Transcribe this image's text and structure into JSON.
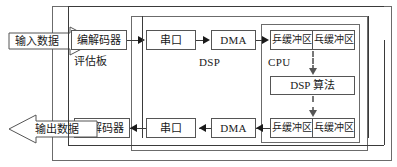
{
  "diagram": {
    "colors": {
      "line": "#3a3a3a",
      "box_border": "#555555",
      "container_border": "#6b6b6b",
      "dashed": "#777777",
      "background": "#ffffff",
      "text": "#1a1a1a"
    },
    "containers": {
      "eval_board": {
        "label": "评估板"
      },
      "dsp": {
        "label": "DSP"
      },
      "cpu": {
        "label": "CPU"
      }
    },
    "flows": {
      "input": {
        "label": "输入数据"
      },
      "output": {
        "label": "输出数据"
      }
    },
    "blocks": {
      "codec_in": {
        "label": "编解码器"
      },
      "codec_out": {
        "label": "编解码器"
      },
      "serial_in": {
        "label": "串口"
      },
      "serial_out": {
        "label": "串口"
      },
      "dma_in": {
        "label": "DMA"
      },
      "dma_out": {
        "label": "DMA"
      },
      "ping_buffer_in": {
        "label": "乒缓冲区"
      },
      "pong_buffer_in": {
        "label": "乓缓冲区"
      },
      "ping_buffer_out": {
        "label": "乒缓冲区"
      },
      "pong_buffer_out": {
        "label": "乓缓冲区"
      },
      "dsp_algorithm": {
        "label": "DSP 算法"
      }
    }
  }
}
